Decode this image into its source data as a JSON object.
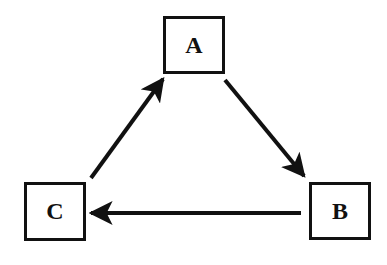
{
  "diagram": {
    "type": "cycle",
    "nodes": [
      {
        "id": "A",
        "label": "A"
      },
      {
        "id": "B",
        "label": "B"
      },
      {
        "id": "C",
        "label": "C"
      }
    ],
    "edges": [
      {
        "from": "A",
        "to": "B"
      },
      {
        "from": "B",
        "to": "C"
      },
      {
        "from": "C",
        "to": "A"
      }
    ],
    "colors": {
      "stroke": "#111111",
      "background": "#ffffff"
    }
  }
}
